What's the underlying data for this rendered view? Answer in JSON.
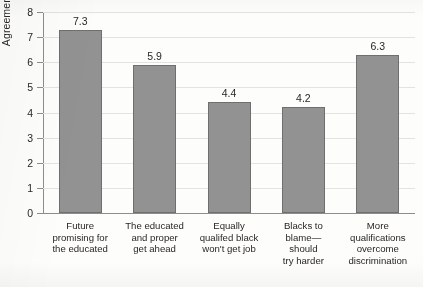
{
  "chart_data": {
    "type": "bar",
    "title": "",
    "xlabel": "",
    "ylabel": "Agreement scale",
    "ylim": [
      0,
      8
    ],
    "yticks": [
      0,
      1,
      2,
      3,
      4,
      5,
      6,
      7,
      8
    ],
    "ytick_labels": [
      "0",
      "1",
      "2",
      "3",
      "4",
      "5",
      "6",
      "7",
      "8"
    ],
    "grid": true,
    "legend": false,
    "bar_color": "#929292",
    "bar_edge_color": "#6f6f6f",
    "categories": [
      "Future promising for the educated",
      "The educated and proper get ahead",
      "Equally qualifed black won't get job",
      "Blacks to blame— should try harder",
      "More qualifications overcome discrimination"
    ],
    "category_lines": [
      [
        "Future",
        "promising for",
        "the educated"
      ],
      [
        "The educated",
        "and proper",
        "get ahead"
      ],
      [
        "Equally",
        "qualifed black",
        "won't get job"
      ],
      [
        "Blacks to",
        "blame—",
        "should",
        "try harder"
      ],
      [
        "More",
        "qualifications",
        "overcome",
        "discrimination"
      ]
    ],
    "values": [
      7.3,
      5.9,
      4.4,
      4.2,
      6.3
    ],
    "value_labels": [
      "7.3",
      "5.9",
      "4.4",
      "4.2",
      "6.3"
    ]
  }
}
